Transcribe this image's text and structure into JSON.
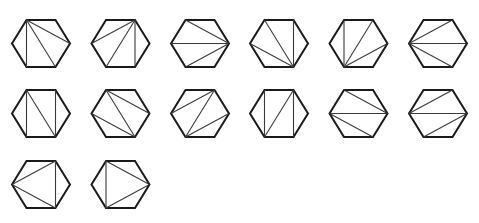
{
  "figure": {
    "hexagon": {
      "vertex_order": [
        "TL",
        "TR",
        "R",
        "BR",
        "BL",
        "L"
      ],
      "half_width": 29,
      "half_height": 23.5,
      "top_edge_half": 14.5
    },
    "layout": {
      "columns_x": [
        41,
        120.5,
        200,
        279,
        358.5,
        438
      ],
      "rows_y": [
        43.5,
        113.5,
        184.5
      ]
    },
    "triangulations": [
      {
        "row": 0,
        "col": 0,
        "diagonals": [
          [
            "TL",
            "BL"
          ],
          [
            "TL",
            "BR"
          ],
          [
            "TL",
            "R"
          ]
        ]
      },
      {
        "row": 0,
        "col": 1,
        "diagonals": [
          [
            "TR",
            "L"
          ],
          [
            "TR",
            "BL"
          ],
          [
            "TR",
            "BR"
          ]
        ]
      },
      {
        "row": 0,
        "col": 2,
        "diagonals": [
          [
            "R",
            "TL"
          ],
          [
            "R",
            "L"
          ],
          [
            "R",
            "BL"
          ]
        ]
      },
      {
        "row": 0,
        "col": 3,
        "diagonals": [
          [
            "BR",
            "TR"
          ],
          [
            "BR",
            "TL"
          ],
          [
            "BR",
            "L"
          ]
        ]
      },
      {
        "row": 0,
        "col": 4,
        "diagonals": [
          [
            "BL",
            "TL"
          ],
          [
            "BL",
            "TR"
          ],
          [
            "BL",
            "R"
          ]
        ]
      },
      {
        "row": 0,
        "col": 5,
        "diagonals": [
          [
            "L",
            "TR"
          ],
          [
            "L",
            "R"
          ],
          [
            "L",
            "BR"
          ]
        ]
      },
      {
        "row": 1,
        "col": 0,
        "diagonals": [
          [
            "TL",
            "BL"
          ],
          [
            "TL",
            "BR"
          ],
          [
            "TR",
            "BR"
          ]
        ]
      },
      {
        "row": 1,
        "col": 1,
        "diagonals": [
          [
            "TL",
            "R"
          ],
          [
            "TL",
            "BR"
          ],
          [
            "L",
            "BR"
          ]
        ]
      },
      {
        "row": 1,
        "col": 2,
        "diagonals": [
          [
            "TR",
            "L"
          ],
          [
            "TR",
            "BL"
          ],
          [
            "BL",
            "R"
          ]
        ]
      },
      {
        "row": 1,
        "col": 3,
        "diagonals": [
          [
            "TL",
            "BL"
          ],
          [
            "BL",
            "TR"
          ],
          [
            "TR",
            "BR"
          ]
        ]
      },
      {
        "row": 1,
        "col": 4,
        "diagonals": [
          [
            "TL",
            "R"
          ],
          [
            "L",
            "R"
          ],
          [
            "L",
            "BR"
          ]
        ]
      },
      {
        "row": 1,
        "col": 5,
        "diagonals": [
          [
            "TR",
            "L"
          ],
          [
            "L",
            "R"
          ],
          [
            "R",
            "BL"
          ]
        ]
      },
      {
        "row": 2,
        "col": 0,
        "diagonals": [
          [
            "L",
            "TR"
          ],
          [
            "TR",
            "BR"
          ],
          [
            "BR",
            "L"
          ]
        ]
      },
      {
        "row": 2,
        "col": 1,
        "diagonals": [
          [
            "TL",
            "R"
          ],
          [
            "R",
            "BL"
          ],
          [
            "BL",
            "TL"
          ]
        ]
      }
    ],
    "colors": {
      "background": "#ffffff",
      "outline": "#1a1a1a",
      "diagonal": "#3a3a3a"
    }
  }
}
